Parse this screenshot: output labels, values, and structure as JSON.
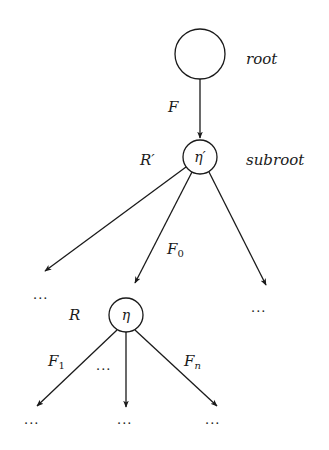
{
  "diagram": {
    "type": "tree",
    "nodes": {
      "root": {
        "label": "",
        "annotation": "root"
      },
      "subroot": {
        "label": "η′",
        "side_label": "R′",
        "annotation": "subroot"
      },
      "eta": {
        "label": "η",
        "side_label": "R"
      }
    },
    "edges": {
      "root_to_subroot": {
        "label": "F"
      },
      "subroot_to_eta": {
        "label_main": "F",
        "label_sub": "0"
      },
      "eta_left": {
        "label_main": "F",
        "label_sub": "1"
      },
      "eta_right": {
        "label_main": "F",
        "label_sub": "n"
      },
      "eta_middle_gap": {
        "label": "···"
      }
    },
    "ellipses": {
      "subroot_left": "···",
      "subroot_right": "···",
      "eta_child_left": "···",
      "eta_child_middle": "···",
      "eta_child_right": "···"
    }
  }
}
